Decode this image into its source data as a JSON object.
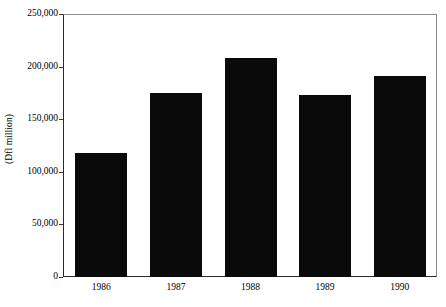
{
  "chart_data": {
    "type": "bar",
    "title": "",
    "subtitle": "",
    "xlabel": "",
    "ylabel": "(Dfl million)",
    "categories": [
      "1986",
      "1987",
      "1988",
      "1989",
      "1990"
    ],
    "values": [
      118000,
      175000,
      208000,
      173000,
      191000
    ],
    "series": [
      {
        "name": "",
        "values": [
          118000,
          175000,
          208000,
          173000,
          191000
        ]
      }
    ],
    "ylim": [
      0,
      250000
    ],
    "yticks": [
      0,
      50000,
      100000,
      150000,
      200000,
      250000
    ],
    "ytick_labels": [
      "0",
      "50,000",
      "100,000",
      "150,000",
      "200,000",
      "250,000"
    ],
    "xtick_labels": [
      "1986",
      "1987",
      "1988",
      "1989",
      "1990"
    ],
    "grid": false,
    "legend": null,
    "legend_position": "none",
    "bar_color": "#0a0a0a",
    "axis_color": "#2a2a2a",
    "frame_color": "#8c8c8c",
    "background_color": "#ffffff",
    "annotations": []
  }
}
